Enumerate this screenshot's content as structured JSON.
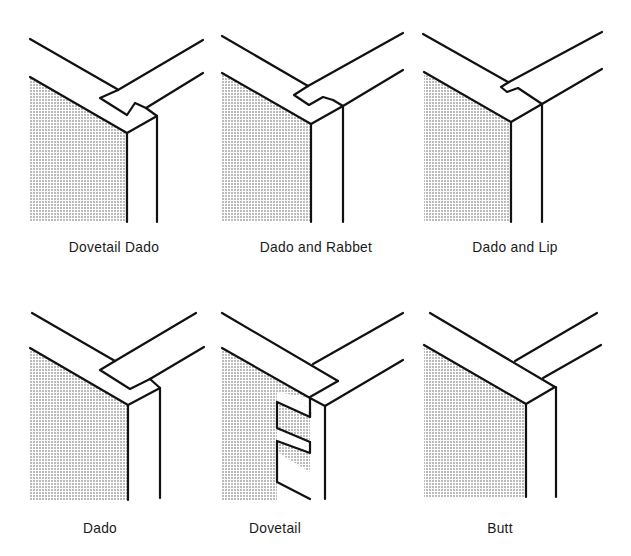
{
  "figure": {
    "panels": [
      {
        "id": "dovetail-dado",
        "label": "Dovetail Dado"
      },
      {
        "id": "dado-and-rabbet",
        "label": "Dado and Rabbet"
      },
      {
        "id": "dado-and-lip",
        "label": "Dado and Lip"
      },
      {
        "id": "dado",
        "label": "Dado"
      },
      {
        "id": "dovetail",
        "label": "Dovetail"
      },
      {
        "id": "butt",
        "label": "Butt"
      }
    ],
    "colors": {
      "line": "#111111",
      "shade_dots": "#555555",
      "background": "#ffffff",
      "text": "#1a1a1a"
    }
  }
}
